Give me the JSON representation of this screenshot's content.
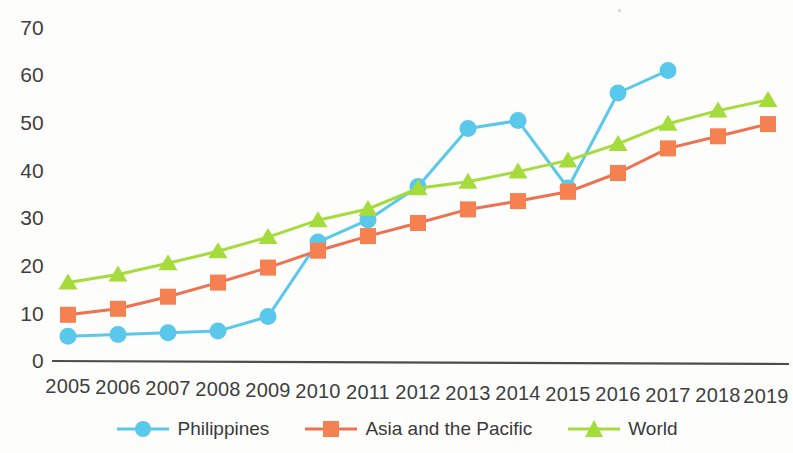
{
  "chart_data": {
    "type": "line",
    "title": "",
    "subtitle": "",
    "xlabel": "",
    "ylabel": "",
    "categories": [
      "2005",
      "2006",
      "2007",
      "2008",
      "2009",
      "2010",
      "2011",
      "2012",
      "2013",
      "2014",
      "2015",
      "2016",
      "2017",
      "2018",
      "2019"
    ],
    "x": [
      2005,
      2006,
      2007,
      2008,
      2009,
      2010,
      2011,
      2012,
      2013,
      2014,
      2015,
      2016,
      2017,
      2018,
      2019
    ],
    "ylim": [
      0,
      70
    ],
    "xlim": [
      2005,
      2019
    ],
    "yticks": [
      0,
      10,
      20,
      30,
      40,
      50,
      60,
      70
    ],
    "ytick_labels": [
      "0",
      "10",
      "20",
      "30",
      "40",
      "50",
      "60",
      "70"
    ],
    "grid": false,
    "legend_position": "bottom",
    "series": [
      {
        "name": "Philippines",
        "color": "#5ac8ea",
        "marker": "circle",
        "values": [
          5.0,
          5.4,
          5.8,
          6.2,
          9.3,
          25.0,
          29.7,
          36.8,
          49.0,
          50.7,
          36.6,
          56.6,
          61.4,
          null,
          null
        ]
      },
      {
        "name": "Asia and the Pacific",
        "color": "#ef7150",
        "marker": "square",
        "values": [
          9.5,
          10.8,
          13.4,
          16.4,
          19.6,
          23.2,
          26.3,
          29.1,
          32.0,
          33.8,
          35.8,
          39.8,
          45.0,
          47.6,
          50.2
        ]
      },
      {
        "name": "World",
        "color": "#a5dc3c",
        "marker": "triangle",
        "values": [
          16.3,
          18.0,
          20.4,
          23.0,
          26.0,
          29.6,
          32.0,
          36.4,
          37.8,
          40.0,
          42.4,
          45.9,
          50.2,
          53.0,
          55.3
        ]
      }
    ]
  },
  "axes": {
    "y_labels": [
      "70",
      "60",
      "50",
      "40",
      "30",
      "20",
      "10",
      "0"
    ],
    "x_labels": [
      "2005",
      "2006",
      "2007",
      "2008",
      "2009",
      "2010",
      "2011",
      "2012",
      "2013",
      "2014",
      "2015",
      "2016",
      "2017",
      "2018",
      "2019"
    ]
  },
  "legend": {
    "items": [
      {
        "label": "Philippines",
        "color": "#5ac8ea",
        "marker": "circle-marker"
      },
      {
        "label": "Asia and the Pacific",
        "color": "#ef7150",
        "marker": "square-marker"
      },
      {
        "label": "World",
        "color": "#a5dc3c",
        "marker": "triangle-marker"
      }
    ]
  }
}
